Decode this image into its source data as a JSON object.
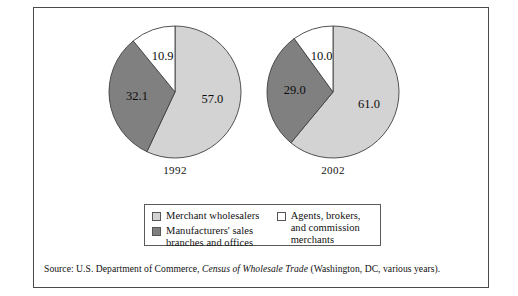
{
  "figure": {
    "source_prefix": "Source: U.S. Department of Commerce, ",
    "source_italic": "Census of Wholesale Trade",
    "source_suffix": " (Washington, DC, various years)."
  },
  "colors": {
    "merchant_wholesalers": "#d3d3d3",
    "manufacturers_branches": "#808080",
    "agents_brokers": "#ffffff",
    "slice_outline": "#3f3f3f",
    "frame_border": "#4a4a4a",
    "text": "#111111"
  },
  "legend": {
    "items": [
      {
        "label": "Merchant wholesalers",
        "color_key": "merchant_wholesalers"
      },
      {
        "label": "Manufacturers' sales branches and offices",
        "color_key": "manufacturers_branches"
      },
      {
        "label": "Agents, brokers, and commission merchants",
        "color_key": "agents_brokers"
      }
    ],
    "left_items": [
      {
        "label": "Merchant wholesalers"
      },
      {
        "label": "Manufacturers' sales branches and offices"
      }
    ],
    "right_items": [
      {
        "label": "Agents, brokers, and commission merchants"
      }
    ]
  },
  "chart_data": {
    "type": "pie",
    "title": "",
    "xlabel": "",
    "ylabel": "",
    "legend_position": "bottom",
    "units": "percent",
    "categories": [
      "Merchant wholesalers",
      "Manufacturers' sales branches and offices",
      "Agents, brokers, and commission merchants"
    ],
    "charts": [
      {
        "year": "1992",
        "labels": [
          "57.0",
          "32.1",
          "10.9"
        ],
        "values": [
          57.0,
          32.1,
          10.9
        ]
      },
      {
        "year": "2002",
        "labels": [
          "61.0",
          "29.0",
          "10.0"
        ],
        "values": [
          61.0,
          29.0,
          10.0
        ]
      }
    ]
  }
}
